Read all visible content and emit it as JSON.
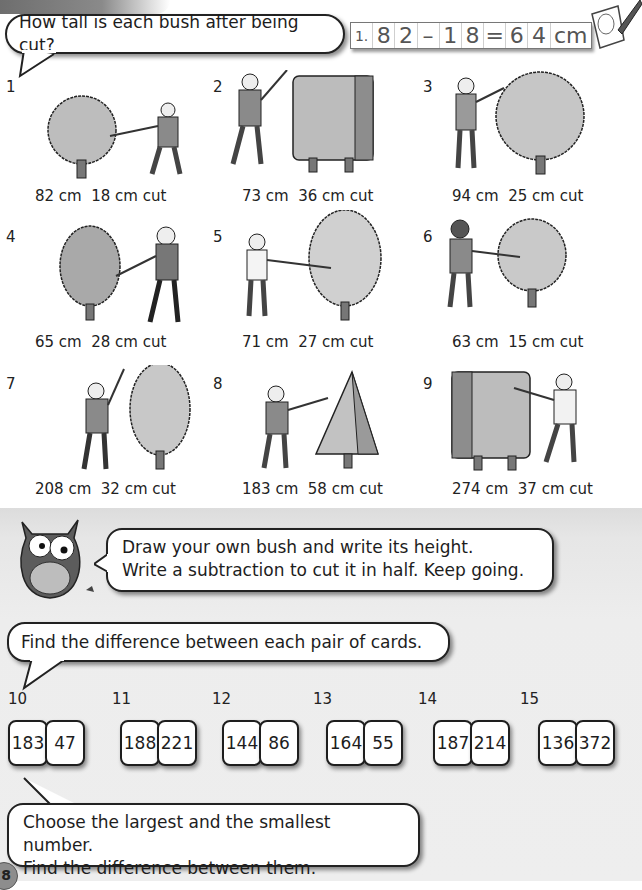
{
  "header": {
    "question_bubble": "How tall is each bush after being cut?",
    "example_answer": {
      "cells": [
        "1.",
        "8",
        "2",
        "–",
        "1",
        "8",
        "=",
        "6",
        "4",
        "cm"
      ]
    }
  },
  "bush_problems": [
    {
      "number": "1",
      "height": "82 cm",
      "cut": "18 cm cut",
      "shape": "round"
    },
    {
      "number": "2",
      "height": "73 cm",
      "cut": "36 cm cut",
      "shape": "box"
    },
    {
      "number": "3",
      "height": "94 cm",
      "cut": "25 cm cut",
      "shape": "round"
    },
    {
      "number": "4",
      "height": "65 cm",
      "cut": "28 cm cut",
      "shape": "oval"
    },
    {
      "number": "5",
      "height": "71 cm",
      "cut": "27 cm cut",
      "shape": "oval"
    },
    {
      "number": "6",
      "height": "63 cm",
      "cut": "15 cm cut",
      "shape": "round"
    },
    {
      "number": "7",
      "height": "208 cm",
      "cut": "32 cm cut",
      "shape": "oval"
    },
    {
      "number": "8",
      "height": "183 cm",
      "cut": "58 cm cut",
      "shape": "cone"
    },
    {
      "number": "9",
      "height": "274 cm",
      "cut": "37 cm cut",
      "shape": "box"
    }
  ],
  "owl_prompt": {
    "line1": "Draw your own bush and write its height.",
    "line2": "Write a subtraction to cut it in half. Keep going."
  },
  "cards_section": {
    "instruction": "Find the difference between each pair of cards.",
    "pairs": [
      {
        "number": "10",
        "a": "183",
        "b": "47"
      },
      {
        "number": "11",
        "a": "188",
        "b": "221"
      },
      {
        "number": "12",
        "a": "144",
        "b": "86"
      },
      {
        "number": "13",
        "a": "164",
        "b": "55"
      },
      {
        "number": "14",
        "a": "187",
        "b": "214"
      },
      {
        "number": "15",
        "a": "136",
        "b": "372"
      }
    ]
  },
  "challenge": {
    "line1": "Choose the largest and the smallest number.",
    "line2": "Find the difference between them."
  },
  "page_number": "8"
}
